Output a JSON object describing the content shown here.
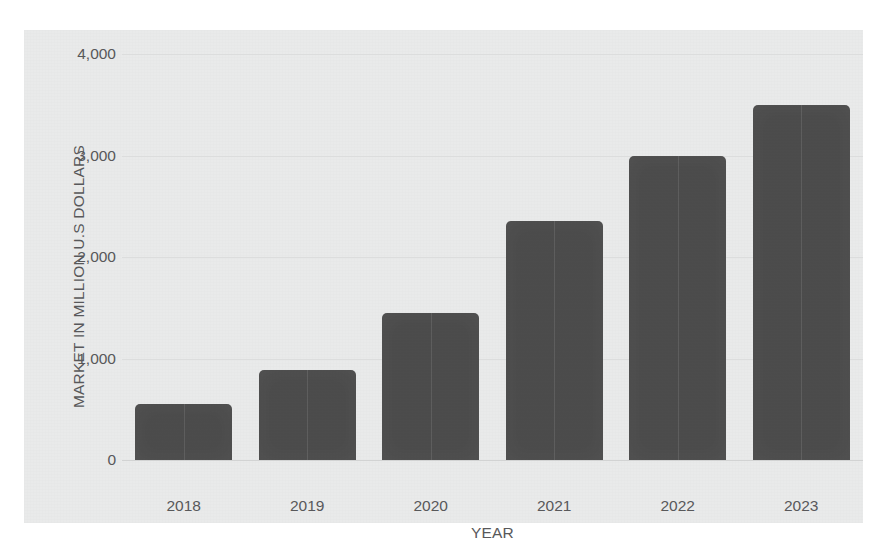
{
  "chart_data": {
    "type": "bar",
    "title": "",
    "subtitle": "",
    "xlabel": "YEAR",
    "ylabel": "MARKET IN MILLION U.S DOLLARS",
    "categories": [
      "2018",
      "2019",
      "2020",
      "2021",
      "2022",
      "2023"
    ],
    "values": [
      550,
      890,
      1450,
      2350,
      3000,
      3500
    ],
    "ylim": [
      0,
      4000
    ],
    "y_ticks": [
      0,
      1000,
      2000,
      3000,
      4000
    ],
    "y_tick_labels": [
      "0",
      "1,000",
      "2,000",
      "3,000",
      "4,000"
    ],
    "grid": true,
    "grid_axis": "y",
    "legend": false,
    "legend_position": "none",
    "annotations": [],
    "series": [
      {
        "name": "Market size",
        "values": [
          550,
          890,
          1450,
          2350,
          3000,
          3500
        ]
      }
    ],
    "colors": {
      "bar": "#4a4a4a",
      "plot_background": "#e9eaea",
      "figure_background": "#ffffff",
      "gridline": "#dcdddd",
      "text": "#58585a"
    }
  }
}
